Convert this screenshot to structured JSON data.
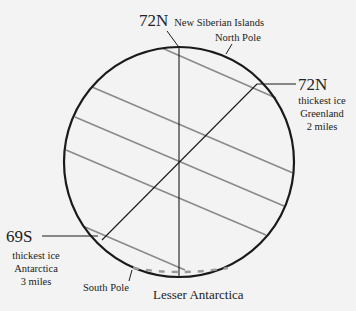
{
  "diagram": {
    "colors": {
      "background": "#f3f3f3",
      "outline": "#1a1a1a",
      "latitude_lines": "#8a8a8a",
      "text": "#222222"
    },
    "labels": {
      "top_lat": "72N",
      "top_place": "New Siberian Islands",
      "north_pole": "North Pole",
      "right_lat": "72N",
      "right_line1": "thickest ice",
      "right_line2": "Greenland",
      "right_line3": "2 miles",
      "left_lat": "69S",
      "left_line1": "thickest ice",
      "left_line2": "Antarctica",
      "left_line3": "3 miles",
      "south_pole": "South Pole",
      "bottom_place": "Lesser Antarctica"
    }
  }
}
